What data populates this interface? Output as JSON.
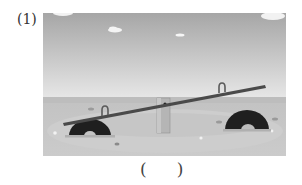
{
  "question": {
    "number_label": "(1)",
    "image": {
      "description": "Seesaw on a sandy playground with two half-buried tires, grey sky with small clouds",
      "icon": "seesaw-illustration",
      "colors": {
        "sky_top": "#a9a9a9",
        "sky_bottom": "#e4e4e4",
        "ground": "#c4c4c4",
        "ground_light": "#d3d3d3",
        "plank": "#4a4a4a",
        "tire": "#1f1f1f",
        "post": "#b3b3b3"
      }
    },
    "answer_open": "(",
    "answer_close": ")"
  }
}
